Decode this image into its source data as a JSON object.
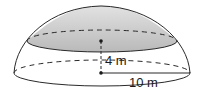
{
  "figure": {
    "type": "hemisphere-with-cap",
    "colors": {
      "stroke": "#2a2a2a",
      "cap_fill_top": "#d4d4d4",
      "cap_fill_bottom": "#b8b8b8",
      "background": "#ffffff"
    },
    "labels": {
      "height": "4 m",
      "radius": "10 m"
    }
  }
}
